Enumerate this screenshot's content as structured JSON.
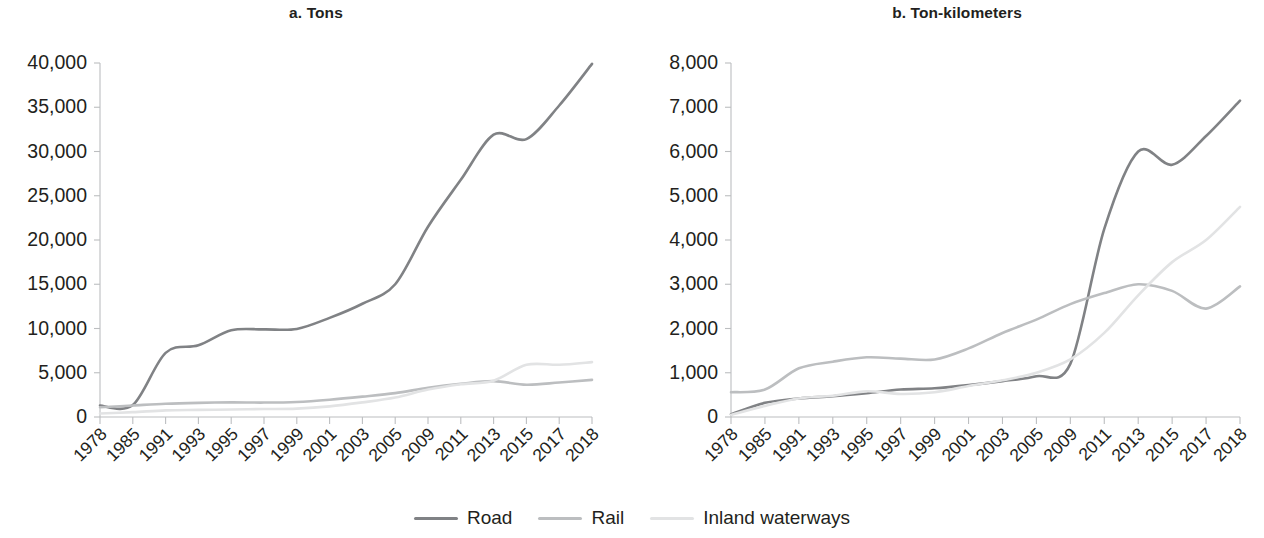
{
  "figure": {
    "background": "#ffffff",
    "series_colors": {
      "road": "#808285",
      "rail": "#bcbec0",
      "inland_waterways": "#e2e3e4"
    }
  },
  "legend": {
    "position": "bottom-center",
    "items": [
      {
        "label": "Road",
        "color": "#808285",
        "key": "road"
      },
      {
        "label": "Rail",
        "color": "#bcbec0",
        "key": "rail"
      },
      {
        "label": "Inland waterways",
        "color": "#e2e3e4",
        "key": "inland_waterways"
      }
    ]
  },
  "panels": {
    "a": {
      "title": "a. Tons"
    },
    "b": {
      "title": "b. Ton-kilometers"
    }
  },
  "chart_data": [
    {
      "type": "line",
      "title": "a. Tons",
      "xlabel": "",
      "ylabel": "",
      "grid": false,
      "legend_position": "bottom",
      "ylim": [
        0,
        40000
      ],
      "yticks": [
        0,
        5000,
        10000,
        15000,
        20000,
        25000,
        30000,
        35000,
        40000
      ],
      "ytick_labels": [
        "0",
        "5,000",
        "10,000",
        "15,000",
        "20,000",
        "25,000",
        "30,000",
        "35,000",
        "40,000"
      ],
      "categories": [
        "1978",
        "1985",
        "1991",
        "1993",
        "1995",
        "1997",
        "1999",
        "2001",
        "2003",
        "2005",
        "2009",
        "2011",
        "2013",
        "2015",
        "2017",
        "2018"
      ],
      "series": [
        {
          "name": "Road",
          "color": "#808285",
          "values": [
            1300,
            1350,
            7250,
            8100,
            9800,
            9900,
            9950,
            11200,
            12800,
            15000,
            21500,
            26800,
            31900,
            31400,
            35200,
            39900
          ]
        },
        {
          "name": "Rail",
          "color": "#bcbec0",
          "values": [
            1100,
            1300,
            1500,
            1600,
            1650,
            1630,
            1700,
            1950,
            2300,
            2700,
            3300,
            3750,
            4050,
            3650,
            3900,
            4200
          ]
        },
        {
          "name": "Inland waterways",
          "color": "#e2e3e4",
          "values": [
            400,
            550,
            750,
            800,
            850,
            900,
            950,
            1200,
            1650,
            2200,
            3100,
            3700,
            4100,
            5900,
            5900,
            6200
          ]
        }
      ]
    },
    {
      "type": "line",
      "title": "b. Ton-kilometers",
      "xlabel": "",
      "ylabel": "",
      "grid": false,
      "legend_position": "bottom",
      "ylim": [
        0,
        8000
      ],
      "yticks": [
        0,
        1000,
        2000,
        3000,
        4000,
        5000,
        6000,
        7000,
        8000
      ],
      "ytick_labels": [
        "0",
        "1,000",
        "2,000",
        "3,000",
        "4,000",
        "5,000",
        "6,000",
        "7,000",
        "8,000"
      ],
      "categories": [
        "1978",
        "1985",
        "1991",
        "1993",
        "1995",
        "1997",
        "1999",
        "2001",
        "2003",
        "2005",
        "2009",
        "2011",
        "2013",
        "2015",
        "2017",
        "2018"
      ],
      "series": [
        {
          "name": "Road",
          "color": "#808285",
          "values": [
            60,
            320,
            420,
            470,
            540,
            620,
            650,
            720,
            810,
            920,
            1200,
            4250,
            6000,
            5700,
            6350,
            7150
          ]
        },
        {
          "name": "Rail",
          "color": "#bcbec0",
          "values": [
            560,
            620,
            1100,
            1250,
            1350,
            1320,
            1300,
            1550,
            1900,
            2200,
            2550,
            2800,
            3000,
            2850,
            2450,
            2950
          ]
        },
        {
          "name": "Inland waterways",
          "color": "#e2e3e4",
          "values": [
            50,
            250,
            420,
            480,
            580,
            520,
            560,
            700,
            830,
            1000,
            1300,
            1900,
            2750,
            3500,
            4000,
            4750
          ]
        }
      ]
    }
  ]
}
